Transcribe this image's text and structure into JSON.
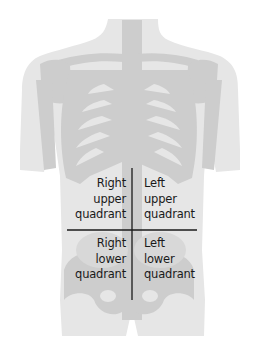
{
  "diagram": {
    "colors": {
      "background": "#ffffff",
      "body_silhouette": "#e6e6e6",
      "bones": "#cdcdcd",
      "divider_lines": "#1a1a1a",
      "text": "#1a1a1a"
    },
    "quadrants": [
      {
        "id": "ruq",
        "lines": [
          "Right",
          "upper",
          "quadrant"
        ]
      },
      {
        "id": "luq",
        "lines": [
          "Left",
          "upper",
          "quadrant"
        ]
      },
      {
        "id": "rlq",
        "lines": [
          "Right",
          "lower",
          "quadrant"
        ]
      },
      {
        "id": "llq",
        "lines": [
          "Left",
          "lower",
          "quadrant"
        ]
      }
    ]
  }
}
